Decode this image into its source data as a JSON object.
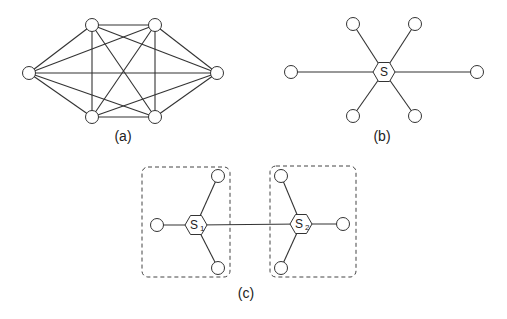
{
  "figure": {
    "panels": [
      {
        "id": "a",
        "caption": "(a)",
        "description": "Fully connected mesh of 6 nodes (complete graph K6)",
        "nodes": [
          {
            "id": "L",
            "x": 29,
            "y": 73
          },
          {
            "id": "TL",
            "x": 92,
            "y": 25
          },
          {
            "id": "TR",
            "x": 155,
            "y": 25
          },
          {
            "id": "R",
            "x": 217,
            "y": 73
          },
          {
            "id": "BL",
            "x": 92,
            "y": 117
          },
          {
            "id": "BR",
            "x": 155,
            "y": 117
          }
        ],
        "edges": "all-pairs"
      },
      {
        "id": "b",
        "caption": "(b)",
        "description": "Star topology with a single central switch S and 6 end nodes",
        "hub": {
          "label": "S",
          "sub": "",
          "x": 384,
          "y": 72
        },
        "nodes": [
          {
            "id": "L",
            "x": 291,
            "y": 72
          },
          {
            "id": "R",
            "x": 477,
            "y": 72
          },
          {
            "id": "TL",
            "x": 353,
            "y": 24
          },
          {
            "id": "TR",
            "x": 415,
            "y": 24
          },
          {
            "id": "BL",
            "x": 353,
            "y": 116
          },
          {
            "id": "BR",
            "x": 415,
            "y": 116
          }
        ]
      },
      {
        "id": "c",
        "caption": "(c)",
        "description": "Two interconnected switches S1 and S2, each with 3 end nodes inside a dashed group box",
        "hubs": [
          {
            "label": "S",
            "sub": "1",
            "x": 196,
            "y": 225
          },
          {
            "label": "S",
            "sub": "2",
            "x": 301,
            "y": 224
          }
        ],
        "groups": [
          {
            "x": 142,
            "y": 167,
            "w": 88,
            "h": 110
          },
          {
            "x": 270,
            "y": 166,
            "w": 86,
            "h": 111
          }
        ],
        "nodes_s1": [
          {
            "id": "L",
            "x": 157,
            "y": 225
          },
          {
            "id": "TR",
            "x": 218,
            "y": 176
          },
          {
            "id": "BR",
            "x": 218,
            "y": 268
          }
        ],
        "nodes_s2": [
          {
            "id": "R",
            "x": 343,
            "y": 224
          },
          {
            "id": "TL",
            "x": 281,
            "y": 176
          },
          {
            "id": "BL",
            "x": 281,
            "y": 268
          }
        ]
      }
    ],
    "colors": {
      "stroke": "#333333",
      "background": "#ffffff"
    }
  }
}
